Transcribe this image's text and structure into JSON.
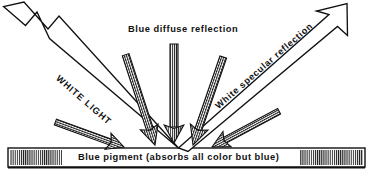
{
  "figure": {
    "kind": "optics-diagram",
    "title": "Blue diffuse reflection",
    "background_color": "#ffffff",
    "ink_color": "#111111"
  },
  "labels": {
    "diffuse_title": "Blue diffuse reflection",
    "white_light": "WHITE LIGHT",
    "specular": "White specular reflection",
    "pigment_bar": "Blue pigment (absorbs all color but blue)"
  },
  "surface": {
    "name": "Blue pigment (absorbs all color but blue)",
    "bar_left": 8,
    "bar_right": 365,
    "bar_top": 148,
    "bar_bottom": 167,
    "hatch_ends": [
      "left",
      "right"
    ]
  },
  "incidence_point": {
    "x": 178,
    "y": 148
  },
  "rays": [
    {
      "name": "white-light-incident",
      "label": "WHITE LIGHT",
      "style": "hollow-outline",
      "direction": "incoming",
      "from": {
        "x": 14,
        "y": 6
      },
      "to": {
        "x": 178,
        "y": 148
      },
      "tail": "notched-chevron"
    },
    {
      "name": "white-specular-reflected",
      "label": "White specular reflection",
      "style": "hollow-outline",
      "direction": "outgoing",
      "from": {
        "x": 178,
        "y": 148
      },
      "to": {
        "x": 340,
        "y": 12
      },
      "head": "open-outline-arrowhead"
    },
    {
      "name": "diffuse-ray-far-left",
      "style": "hatched-filled",
      "direction": "outgoing",
      "angle_deg": 160,
      "from": {
        "x": 124,
        "y": 147
      },
      "to": {
        "x": 47,
        "y": 118
      }
    },
    {
      "name": "diffuse-ray-left",
      "style": "hatched-filled",
      "direction": "outgoing",
      "angle_deg": 118,
      "from": {
        "x": 155,
        "y": 145
      },
      "to": {
        "x": 126,
        "y": 55
      }
    },
    {
      "name": "diffuse-ray-center",
      "style": "hatched-filled",
      "direction": "outgoing",
      "angle_deg": 90,
      "from": {
        "x": 174,
        "y": 142
      },
      "to": {
        "x": 174,
        "y": 44
      }
    },
    {
      "name": "diffuse-ray-right",
      "style": "hatched-filled",
      "direction": "outgoing",
      "angle_deg": 62,
      "from": {
        "x": 193,
        "y": 145
      },
      "to": {
        "x": 222,
        "y": 58
      }
    },
    {
      "name": "diffuse-ray-far-right",
      "style": "hatched-filled",
      "direction": "outgoing",
      "angle_deg": 24,
      "from": {
        "x": 212,
        "y": 147
      },
      "to": {
        "x": 276,
        "y": 112
      }
    }
  ]
}
